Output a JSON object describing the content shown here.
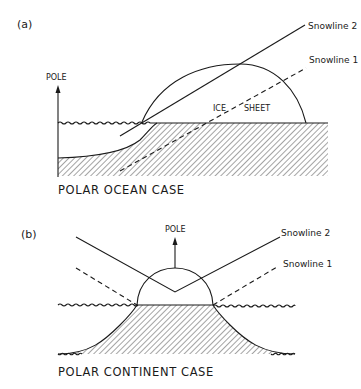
{
  "figure": {
    "panel_a": {
      "label": "(a)",
      "pole_label": "POLE",
      "snowline_2_label": "Snowline 2",
      "snowline_1_label": "Snowline 1",
      "ice_label_1": "ICE",
      "ice_label_2": "SHEET",
      "caption": "POLAR OCEAN CASE"
    },
    "panel_b": {
      "label": "(b)",
      "pole_label": "POLE",
      "snowline_2_label": "Snowline 2",
      "snowline_1_label": "Snowline 1",
      "caption": "POLAR CONTINENT CASE"
    },
    "colors": {
      "ink": "#1a1a1a",
      "background": "#ffffff"
    }
  }
}
